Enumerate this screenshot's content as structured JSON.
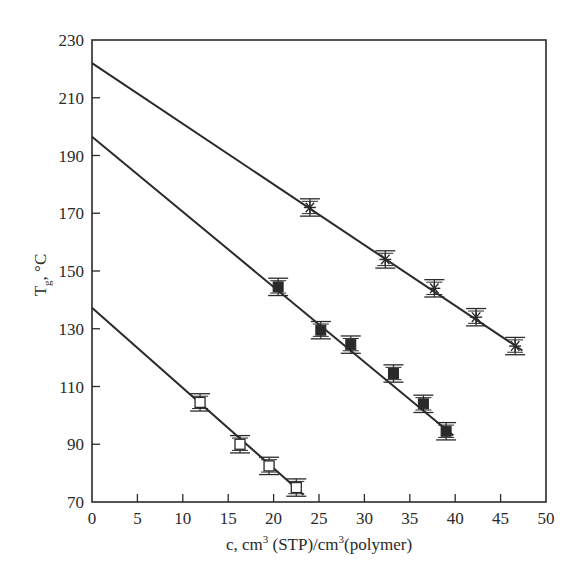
{
  "chart_data": {
    "type": "scatter",
    "title": "",
    "xlabel": "c, cm3 (STP)/cm3(polymer)",
    "xlabel_parts": {
      "prefix": "c, cm",
      "sup1": "3",
      "middle": " (STP)/cm",
      "sup2": "3",
      "suffix": "(polymer)"
    },
    "ylabel": "Tg, °C",
    "ylabel_parts": {
      "main": "T",
      "sub": "g",
      "suffix": ", °C"
    },
    "xlim": [
      0,
      50
    ],
    "ylim": [
      70,
      230
    ],
    "x_ticks": [
      0,
      5,
      10,
      15,
      20,
      25,
      30,
      35,
      40,
      45,
      50
    ],
    "y_ticks": [
      70,
      90,
      110,
      130,
      150,
      170,
      190,
      210,
      230
    ],
    "grid": false,
    "legend": null,
    "error_bar": 3,
    "series": [
      {
        "name": "asterisk series",
        "marker": "asterisk",
        "fit_line": {
          "intercept": 222,
          "slope": -2.1
        },
        "points": [
          {
            "x": 24.0,
            "y": 172
          },
          {
            "x": 32.3,
            "y": 154
          },
          {
            "x": 37.7,
            "y": 144
          },
          {
            "x": 42.3,
            "y": 134
          },
          {
            "x": 46.6,
            "y": 124
          }
        ]
      },
      {
        "name": "filled square series",
        "marker": "filled-square",
        "fit_line": {
          "intercept": 196.5,
          "slope": -2.6
        },
        "points": [
          {
            "x": 20.5,
            "y": 144.5
          },
          {
            "x": 25.2,
            "y": 129.5
          },
          {
            "x": 28.5,
            "y": 124.5
          },
          {
            "x": 33.2,
            "y": 114.5
          },
          {
            "x": 36.5,
            "y": 104
          },
          {
            "x": 39.0,
            "y": 94.5
          }
        ]
      },
      {
        "name": "open square series",
        "marker": "open-square",
        "fit_line": {
          "intercept": 137.3,
          "slope": -2.78
        },
        "points": [
          {
            "x": 11.9,
            "y": 104.5
          },
          {
            "x": 16.3,
            "y": 90
          },
          {
            "x": 19.5,
            "y": 82.5
          },
          {
            "x": 22.5,
            "y": 75
          }
        ]
      }
    ]
  },
  "colors": {
    "ink": "#2a2a2a",
    "background": "#ffffff"
  }
}
